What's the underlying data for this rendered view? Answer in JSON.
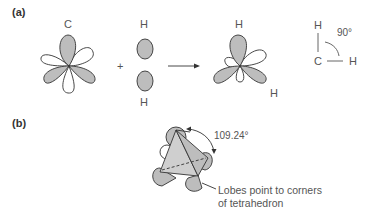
{
  "panels": {
    "a": {
      "label": "(a)",
      "carbon_label": "C",
      "h_top_label": "H",
      "h_bottom_label": "H",
      "plus": "+",
      "product_h_top": "H",
      "product_h_right": "H",
      "angle_h": "H",
      "angle_c": "C",
      "angle_h_right": "H",
      "angle_value": "90°"
    },
    "b": {
      "label": "(b)",
      "angle_value": "109.24°",
      "annotation_line1": "Lobes point to corners",
      "annotation_line2": "of tetrahedron"
    }
  },
  "colors": {
    "lobe_fill": "#bdbdbd",
    "lobe_stroke": "#333333",
    "text": "#555555"
  }
}
